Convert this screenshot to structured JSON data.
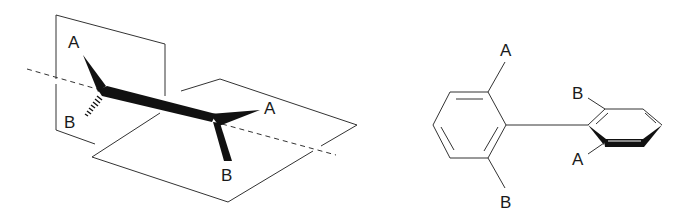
{
  "figure": {
    "left_panel": {
      "description": "3D perspective of biphenyl-like axial chirality with two perpendicular planes",
      "labels": {
        "left_top": "A",
        "left_bottom": "B",
        "right_top": "A",
        "right_bottom": "B"
      },
      "elements": [
        "vertical-plane",
        "horizontal-plane",
        "rotation-axis-dashed",
        "central-bond",
        "wedge-bonds",
        "hashed-bond"
      ]
    },
    "right_panel": {
      "description": "Biphenyl with ortho substituents; right ring drawn tilted perpendicular",
      "labels": {
        "ring1_top": "A",
        "ring1_bottom": "B",
        "ring2_top": "B",
        "ring2_bottom": "A"
      },
      "elements": [
        "left-benzene-ring",
        "biaryl-bond",
        "tilted-benzene-ring"
      ]
    },
    "colors": {
      "line": "#333333",
      "bond_fill": "#111111",
      "background": "#ffffff"
    }
  }
}
